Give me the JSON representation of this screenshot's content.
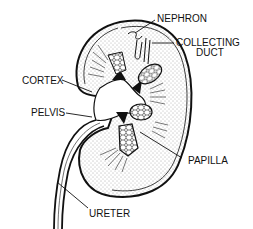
{
  "diagram": {
    "labels": {
      "nephron": "NEPHRON",
      "collecting_duct_line1": "COLLECTING",
      "collecting_duct_line2": "DUCT",
      "cortex": "CORTEX",
      "pelvis": "PELVIS",
      "papilla": "PAPILLA",
      "ureter": "URETER"
    },
    "colors": {
      "ink": "#111111",
      "background": "#ffffff",
      "stipple": "#555555"
    }
  }
}
